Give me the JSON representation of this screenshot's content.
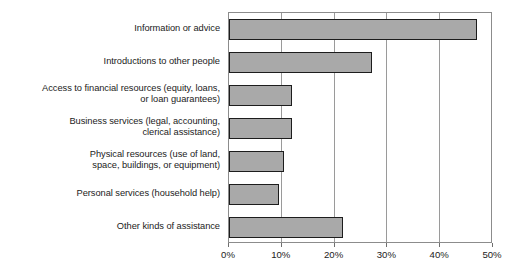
{
  "chart_data": {
    "type": "bar",
    "orientation": "horizontal",
    "title": "",
    "subtitle": "",
    "xlabel": "",
    "ylabel": "",
    "xlim": [
      0,
      50
    ],
    "xticks": [
      0,
      10,
      20,
      30,
      40,
      50
    ],
    "xtick_labels": [
      "0%",
      "10%",
      "20%",
      "30%",
      "40%",
      "50%"
    ],
    "grid": true,
    "grid_axis": "x",
    "legend": false,
    "legend_position": "none",
    "bar_fill_color": "#a9a9a9",
    "bar_edge_color": "#1d1d1d",
    "plot_border_color": "#8c8c8c",
    "gridline_color": "#9a9a9a",
    "background_color": "#ffffff",
    "text_color": "#1b1b1b",
    "categories": [
      "Information or advice",
      "Introductions to other people",
      "Access to financial resources (equity, loans,\nor loan guarantees)",
      "Business services (legal, accounting,\nclerical assistance)",
      "Physical resources (use of land,\nspace, buildings, or equipment)",
      "Personal services (household help)",
      "Other kinds of assistance"
    ],
    "values": [
      47,
      27,
      12,
      12,
      10.5,
      9.5,
      21.5
    ],
    "bars": [
      {
        "label": "Information or advice",
        "value": 47
      },
      {
        "label": "Introductions to other people",
        "value": 27
      },
      {
        "label": "Access to financial resources (equity, loans,\nor loan guarantees)",
        "value": 12
      },
      {
        "label": "Business services (legal, accounting,\nclerical assistance)",
        "value": 12
      },
      {
        "label": "Physical resources (use of land,\nspace, buildings, or equipment)",
        "value": 10.5
      },
      {
        "label": "Personal services (household help)",
        "value": 9.5
      },
      {
        "label": "Other kinds of assistance",
        "value": 21.5
      }
    ]
  }
}
